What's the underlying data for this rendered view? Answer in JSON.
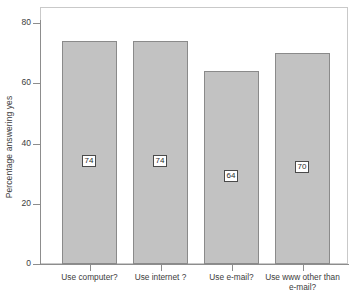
{
  "chart_data": {
    "type": "bar",
    "title": "",
    "xlabel": "",
    "ylabel": "Percentage answering yes",
    "categories": [
      "Use computer?",
      "Use internet ?",
      "Use e-mail?",
      "Use www other than e-mail?"
    ],
    "values": [
      74,
      74,
      64,
      70
    ],
    "data_labels": [
      "74",
      "74",
      "64",
      "70"
    ],
    "ylim": [
      0,
      84
    ],
    "y_ticks": [
      0,
      20,
      40,
      60,
      80
    ],
    "y_tick_labels": [
      "0",
      "20",
      "40",
      "60",
      "80"
    ],
    "grid": false,
    "legend": false,
    "legend_position": "none",
    "bar_fill_color": "#c2c2c2",
    "bar_border_color": "#8a8a8a",
    "axis_color": "#8d8d8d",
    "panel_border_color": "#c9c9c9",
    "background_color": "#ffffff",
    "label_box_fill": "#ffffff",
    "label_box_border": "#4a4a4a"
  },
  "axis": {
    "y_title": "Percentage answering yes"
  },
  "category_lines": [
    [
      "Use computer?"
    ],
    [
      "Use internet ?"
    ],
    [
      "Use e-mail?"
    ],
    [
      "Use www other than",
      "e-mail?"
    ]
  ]
}
